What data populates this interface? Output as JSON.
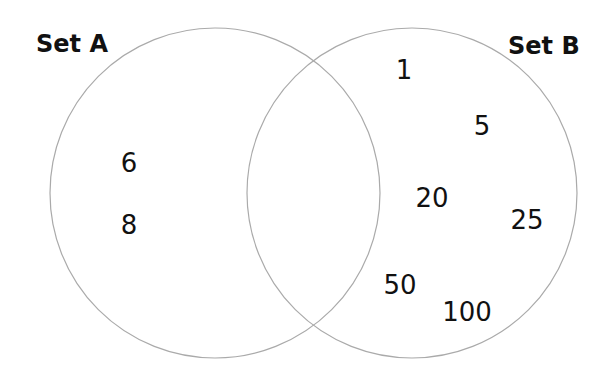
{
  "sets": {
    "a": {
      "label": "Set A",
      "only": [
        "6",
        "8"
      ]
    },
    "b": {
      "label": "Set B",
      "only": [
        "1",
        "5",
        "20",
        "25",
        "50",
        "100"
      ]
    },
    "both": [
      "2",
      "4",
      "10"
    ]
  },
  "colors": {
    "circle": "#aaaaaa",
    "text": "#111111"
  }
}
